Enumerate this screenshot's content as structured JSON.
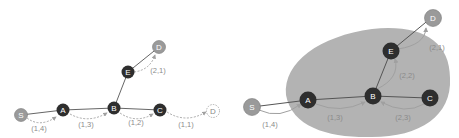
{
  "colors": {
    "dark_node": "#2e2e2e",
    "gray_node": "#9a9a9a",
    "blob": "#b3b3b3",
    "edge": "#666666",
    "flow_arrow": "#a0a0a0",
    "label": "#8a8a8a"
  },
  "left_graph": {
    "nodes": {
      "S": "S",
      "A": "A",
      "B": "B",
      "C": "C",
      "E": "E",
      "D_top": "D",
      "D_right": "D"
    },
    "edge_labels": {
      "SA": "(1,4)",
      "AB": "(1,3)",
      "BC": "(1,2)",
      "CD": "(1,1)",
      "ED": "(2,1)"
    }
  },
  "right_graph": {
    "nodes": {
      "S": "S",
      "A": "A",
      "B": "B",
      "C": "C",
      "E": "E",
      "D": "D"
    },
    "edge_labels": {
      "SA": "(1,4)",
      "AB": "(1,3)",
      "CB": "(2,3)",
      "BE": "(2,2)",
      "ED": "(2,1)"
    }
  }
}
